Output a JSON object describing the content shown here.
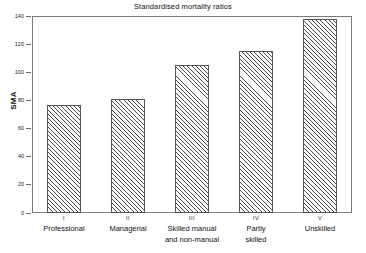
{
  "chart_data": {
    "type": "bar",
    "title": "Standardised mortality ratios",
    "xlabel": "",
    "ylabel": "SMA",
    "ylim": [
      0,
      140
    ],
    "yticks": [
      0,
      20,
      40,
      60,
      80,
      100,
      120,
      140
    ],
    "grid": false,
    "legend": "none",
    "categories": [
      "Professional",
      "Managerial",
      "Skilled manual and non-manual",
      "Partly skilled",
      "Unskilled"
    ],
    "category_codes": [
      "I",
      "II",
      "III",
      "IV",
      "V"
    ],
    "values": [
      77,
      81,
      105,
      115,
      138
    ]
  },
  "axis": {
    "y_label": "SMA",
    "tick_labels": [
      "140",
      "120",
      "100",
      "80",
      "60",
      "40",
      "20",
      "0"
    ]
  },
  "categories": [
    {
      "roman": "I",
      "line1": "Professional",
      "line2": "",
      "value": 77
    },
    {
      "roman": "II",
      "line1": "Managerial",
      "line2": "",
      "value": 81
    },
    {
      "roman": "III",
      "line1": "Skilled manual",
      "line2": "and non-manual",
      "value": 105
    },
    {
      "roman": "IV",
      "line1": "Partly",
      "line2": "skilled",
      "value": 115
    },
    {
      "roman": "V",
      "line1": "Unskilled",
      "line2": "",
      "value": 138
    }
  ]
}
